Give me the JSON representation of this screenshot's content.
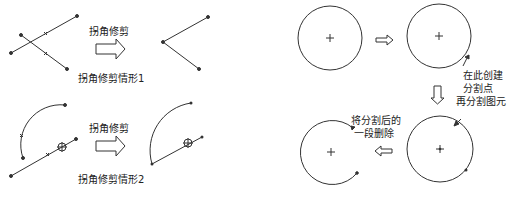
{
  "left_panel": {
    "case1": {
      "arrow_label": "拐角修剪",
      "caption": "拐角修剪情形1"
    },
    "case2": {
      "arrow_label": "拐角修剪",
      "caption": "拐角修剪情形2"
    }
  },
  "right_panel": {
    "annotation_split_point_line1": "在此创建",
    "annotation_split_point_line2": "分割点",
    "annotation_split_entity": "再分割图元",
    "annotation_delete_line1": "将分割后的",
    "annotation_delete_line2": "一段删除"
  },
  "colors": {
    "stroke": "#333333",
    "background": "#ffffff",
    "text": "#222222"
  }
}
